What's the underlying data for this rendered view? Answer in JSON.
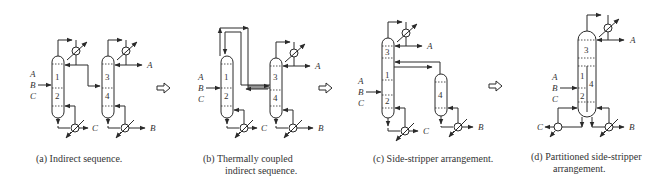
{
  "figure": {
    "panels": [
      {
        "id": "a",
        "caption_line1": "(a) Indirect sequence.",
        "caption_line2": "",
        "feed_labels": [
          "A",
          "B",
          "C"
        ],
        "section_labels": [
          "1",
          "2",
          "3",
          "4"
        ],
        "product_labels": [
          "A",
          "C",
          "B"
        ]
      },
      {
        "id": "b",
        "caption_line1": "(b)   Thermally coupled",
        "caption_line2": "indirect sequence.",
        "feed_labels": [
          "A",
          "B",
          "C"
        ],
        "section_labels": [
          "1",
          "2",
          "3",
          "4"
        ],
        "product_labels": [
          "A",
          "C",
          "B"
        ]
      },
      {
        "id": "c",
        "caption_line1": "(c)   Side-stripper arrangement.",
        "caption_line2": "",
        "feed_labels": [
          "A",
          "B",
          "C"
        ],
        "section_labels": [
          "3",
          "1",
          "2",
          "4"
        ],
        "product_labels": [
          "A",
          "C",
          "B"
        ]
      },
      {
        "id": "d",
        "caption_line1": "(d)   Partitioned side-stripper",
        "caption_line2": "arrangement.",
        "feed_labels": [
          "A",
          "B",
          "C"
        ],
        "section_labels": [
          "3",
          "1",
          "4",
          "2"
        ],
        "product_labels": [
          "A",
          "C",
          "B"
        ]
      }
    ],
    "transition_arrows": [
      "hollow-right-arrow",
      "hollow-right-arrow",
      "hollow-right-arrow"
    ]
  }
}
